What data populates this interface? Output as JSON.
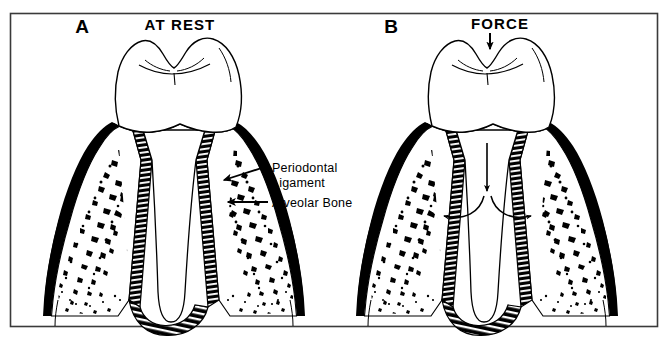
{
  "figure": {
    "background_color": "#ffffff",
    "ink_color": "#000000",
    "frame_color": "#3a3a3a"
  },
  "panels": [
    {
      "id": "panel-a",
      "letter": "A",
      "title": "AT REST",
      "letter_x": 82,
      "letter_y": 33,
      "title_x": 180,
      "title_y": 30
    },
    {
      "id": "panel-b",
      "letter": "B",
      "title": "FORCE",
      "letter_x": 391,
      "letter_y": 33,
      "title_x": 500,
      "title_y": 29
    }
  ],
  "labels": [
    {
      "id": "periodontal-ligament",
      "lines": [
        "Periodontal",
        "Ligament"
      ],
      "text": "Periodontal Ligament",
      "x": 272,
      "y": 172
    },
    {
      "id": "alveolar-bone",
      "lines": [
        "Alveolar  Bone"
      ],
      "text": "Alveolar Bone",
      "x": 272,
      "y": 205
    }
  ],
  "annotations": {
    "force_arrow_label": "FORCE",
    "force_arrow_direction": "down",
    "internal_force_arrow_direction": "down",
    "spread_arrow_left_direction": "left",
    "spread_arrow_right_direction": "right",
    "leader_arrow_direction": "left"
  },
  "structures": [
    {
      "id": "tooth-crown",
      "name": "tooth crown",
      "fill": "#ffffff"
    },
    {
      "id": "tooth-root",
      "name": "tooth root",
      "fill": "#ffffff"
    },
    {
      "id": "periodontal-ligament-band",
      "name": "periodontal ligament",
      "pattern": "hatched"
    },
    {
      "id": "alveolar-bone-trabecular",
      "name": "alveolar bone",
      "pattern": "stippled"
    },
    {
      "id": "cortical-plate",
      "name": "cortical plate",
      "fill": "#000000"
    }
  ]
}
